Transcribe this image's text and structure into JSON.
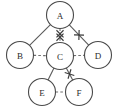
{
  "diagram": {
    "title": "",
    "type": "undirected-graph",
    "background_color": "#ffffff",
    "node_stroke_color": "#4a4a4a",
    "node_fill_color": "#ffffff",
    "solid_edge_color": "#5a5a5a",
    "dashed_edge_color": "#6e6e6e",
    "mark_color": "#3a3a3a",
    "node_radius": 13.5,
    "nodes": [
      {
        "id": "A",
        "label": "A",
        "cx": 60,
        "cy": 15,
        "r": 13.5
      },
      {
        "id": "B",
        "label": "B",
        "cx": 20,
        "cy": 55,
        "r": 13.5
      },
      {
        "id": "C",
        "label": "C",
        "cx": 60,
        "cy": 56,
        "r": 13.5
      },
      {
        "id": "D",
        "label": "D",
        "cx": 98,
        "cy": 55,
        "r": 13.5
      },
      {
        "id": "E",
        "label": "E",
        "cx": 42,
        "cy": 92,
        "r": 13.5
      },
      {
        "id": "F",
        "label": "F",
        "cx": 79,
        "cy": 92,
        "r": 13.5
      }
    ],
    "edges": [
      {
        "id": "A-B",
        "from": "A",
        "to": "B",
        "style": "solid",
        "marks": 0
      },
      {
        "id": "A-C",
        "from": "A",
        "to": "C",
        "style": "dashed",
        "marks": 2
      },
      {
        "id": "A-D",
        "from": "A",
        "to": "D",
        "style": "solid",
        "marks": 1
      },
      {
        "id": "B-C",
        "from": "B",
        "to": "C",
        "style": "dashed",
        "marks": 0
      },
      {
        "id": "C-D",
        "from": "C",
        "to": "D",
        "style": "dashed",
        "marks": 0
      },
      {
        "id": "C-E",
        "from": "C",
        "to": "E",
        "style": "solid",
        "marks": 0
      },
      {
        "id": "C-F",
        "from": "C",
        "to": "F",
        "style": "solid",
        "marks": 1
      },
      {
        "id": "E-F",
        "from": "E",
        "to": "F",
        "style": "dashed",
        "marks": 0
      }
    ],
    "legend": {
      "solid_meaning": "",
      "dashed_meaning": "",
      "mark_meaning": ""
    }
  }
}
